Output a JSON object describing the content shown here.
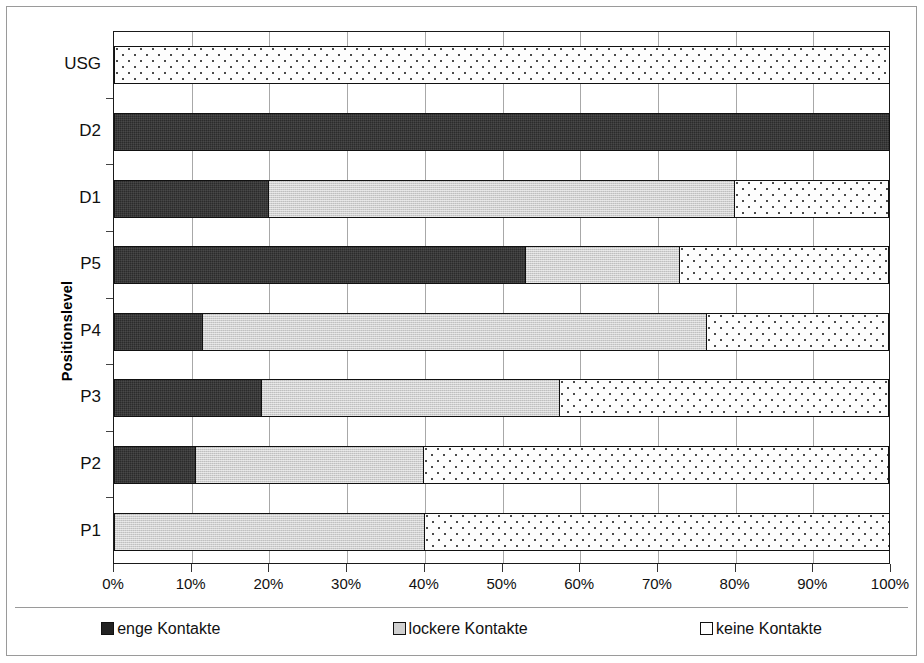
{
  "chart_data": {
    "type": "bar",
    "orientation": "horizontal",
    "stacked": true,
    "normalized_percent": true,
    "title": "",
    "xlabel": "",
    "ylabel": "Positionslevel",
    "xlim": [
      0,
      100
    ],
    "grid": true,
    "legend_position": "bottom",
    "xticks": [
      "0%",
      "10%",
      "20%",
      "30%",
      "40%",
      "50%",
      "60%",
      "70%",
      "80%",
      "90%",
      "100%"
    ],
    "xtick_values": [
      0,
      10,
      20,
      30,
      40,
      50,
      60,
      70,
      80,
      90,
      100
    ],
    "categories": [
      "USG",
      "D2",
      "D1",
      "P5",
      "P4",
      "P3",
      "P2",
      "P1"
    ],
    "series": [
      {
        "name": "enge Kontakte",
        "color": "#2b2b2b",
        "pattern": "solid-dark",
        "values": [
          0,
          100,
          20,
          53,
          11.5,
          19,
          10.5,
          0
        ]
      },
      {
        "name": "lockere Kontakte",
        "color": "#d0d0d0",
        "pattern": "light-gray",
        "values": [
          0,
          0,
          60,
          20,
          65,
          38.5,
          29.5,
          40
        ]
      },
      {
        "name": "keine Kontakte",
        "color": "#ffffff",
        "pattern": "white-dotted",
        "values": [
          100,
          0,
          20,
          27,
          23.5,
          42.5,
          60,
          60
        ]
      }
    ]
  },
  "axis": {
    "y_title": "Positionslevel"
  },
  "legend": {
    "items": [
      {
        "label": "enge Kontakte",
        "swatch": "dark-swatch"
      },
      {
        "label": "lockere Kontakte",
        "swatch": "gray-swatch"
      },
      {
        "label": "keine Kontakte",
        "swatch": "white-swatch"
      }
    ]
  }
}
